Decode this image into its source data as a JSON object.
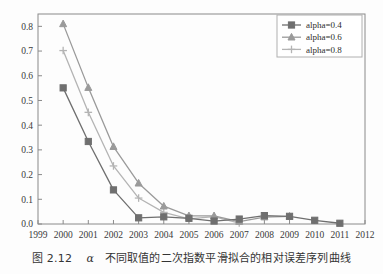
{
  "figure": {
    "caption_prefix": "图 2.12",
    "caption_alpha": "α",
    "caption_text": "不同取值的二次指数平滑拟合的相对误差序列曲线",
    "caption_full": "图 2.12  α 不同取值的二次指数平滑拟合的相对误差序列曲线"
  },
  "colors": {
    "series_alpha_04": "#6f6f6f",
    "series_alpha_06": "#9a9a9a",
    "series_alpha_08": "#b4b4b4",
    "axis": "#8a8a8a",
    "text": "#3a3a3a",
    "background": "#fdfdfd",
    "legend_border": "#b0b0b0"
  },
  "legend": {
    "position": "top-right",
    "entries": [
      {
        "label": "alpha=0.4",
        "marker": "square-marker",
        "color": "#6f6f6f"
      },
      {
        "label": "alpha=0.6",
        "marker": "triangle-marker",
        "color": "#9a9a9a"
      },
      {
        "label": "alpha=0.8",
        "marker": "plus-marker",
        "color": "#b4b4b4"
      }
    ]
  },
  "chart_data": {
    "type": "line",
    "title": "",
    "subtitle": "",
    "xlabel": "",
    "ylabel": "",
    "xlim": [
      1999,
      2012
    ],
    "ylim": [
      0.0,
      0.85
    ],
    "grid": false,
    "legend_position": "top-right",
    "x_ticks": [
      1999,
      2000,
      2001,
      2002,
      2003,
      2004,
      2005,
      2006,
      2007,
      2008,
      2009,
      2010,
      2011,
      2012
    ],
    "x_tick_labels": [
      "1999",
      "2000",
      "2001",
      "2002",
      "2003",
      "2004",
      "2005",
      "2006",
      "2007",
      "2008",
      "2009",
      "2010",
      "2011",
      "2012"
    ],
    "y_ticks": [
      0.0,
      0.1,
      0.2,
      0.3,
      0.4,
      0.5,
      0.6,
      0.7,
      0.8
    ],
    "y_tick_labels": [
      "0.0",
      "0.1",
      "0.2",
      "0.3",
      "0.4",
      "0.5",
      "0.6",
      "0.7",
      "0.8"
    ],
    "series": [
      {
        "name": "alpha=0.4",
        "marker": "square-marker",
        "color": "#6f6f6f",
        "x": [
          2000,
          2001,
          2002,
          2003,
          2004,
          2005,
          2006,
          2007,
          2008,
          2009,
          2010,
          2011
        ],
        "values": [
          0.551,
          0.334,
          0.138,
          0.025,
          0.029,
          0.023,
          0.012,
          0.02,
          0.034,
          0.031,
          0.015,
          0.003
        ]
      },
      {
        "name": "alpha=0.6",
        "marker": "triangle-marker",
        "color": "#9a9a9a",
        "x": [
          2000,
          2001,
          2002,
          2003,
          2004,
          2005,
          2006,
          2007,
          2008,
          2009
        ],
        "values": [
          0.81,
          0.552,
          0.313,
          0.165,
          0.072,
          0.033,
          0.033,
          0.01,
          0.028,
          0.031
        ]
      },
      {
        "name": "alpha=0.8",
        "marker": "plus-marker",
        "color": "#b4b4b4",
        "x": [
          2000,
          2001,
          2002,
          2003,
          2004,
          2005,
          2006,
          2007
        ],
        "values": [
          0.702,
          0.452,
          0.235,
          0.105,
          0.047,
          0.021,
          0.03,
          0.004
        ]
      }
    ]
  }
}
